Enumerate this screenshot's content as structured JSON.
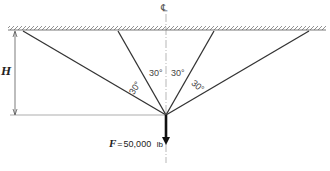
{
  "diagram": {
    "centerline_symbol": "℄",
    "height_label": "H",
    "angles": [
      "30°",
      "30°",
      "30°",
      "30°"
    ],
    "force": {
      "symbol": "F",
      "equals": "=",
      "value": "50,000",
      "unit": "lb"
    }
  }
}
